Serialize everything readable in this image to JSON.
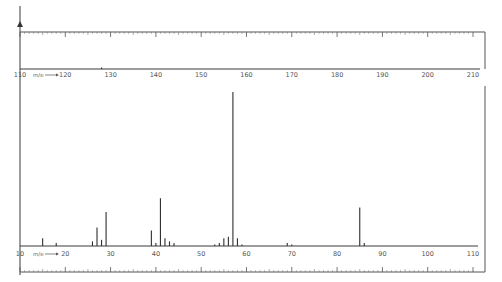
{
  "chart_data": [
    {
      "type": "bar",
      "panel": "upper",
      "title": "",
      "xlabel": "m/e",
      "ylabel": "",
      "xlim": [
        110,
        210
      ],
      "ylim": [
        0,
        100
      ],
      "grid": false,
      "tick_labels": [
        "110",
        "120",
        "130",
        "140",
        "150",
        "160",
        "170",
        "180",
        "190",
        "200",
        "210"
      ],
      "x": [
        128
      ],
      "values": [
        1
      ]
    },
    {
      "type": "bar",
      "panel": "lower",
      "title": "",
      "xlabel": "m/e",
      "ylabel": "",
      "xlim": [
        10,
        110
      ],
      "ylim": [
        0,
        100
      ],
      "grid": false,
      "tick_labels": [
        "10",
        "20",
        "30",
        "40",
        "50",
        "60",
        "70",
        "80",
        "90",
        "100",
        "110"
      ],
      "x": [
        15,
        18,
        26,
        27,
        28,
        29,
        39,
        40,
        41,
        42,
        43,
        44,
        53,
        54,
        55,
        56,
        57,
        58,
        59,
        69,
        70,
        85,
        86
      ],
      "values": [
        5,
        2,
        3,
        12,
        4,
        22,
        10,
        2,
        31,
        5,
        3,
        2,
        1,
        2,
        5,
        6,
        100,
        5,
        1,
        2,
        1,
        25,
        2
      ]
    }
  ],
  "labels": {
    "mz_arrow": "m/e",
    "upper_start": "110",
    "lower_start": "10"
  },
  "colors": {
    "line": "#2e2e2e",
    "frame": "#555555",
    "background": "#ffffff"
  }
}
